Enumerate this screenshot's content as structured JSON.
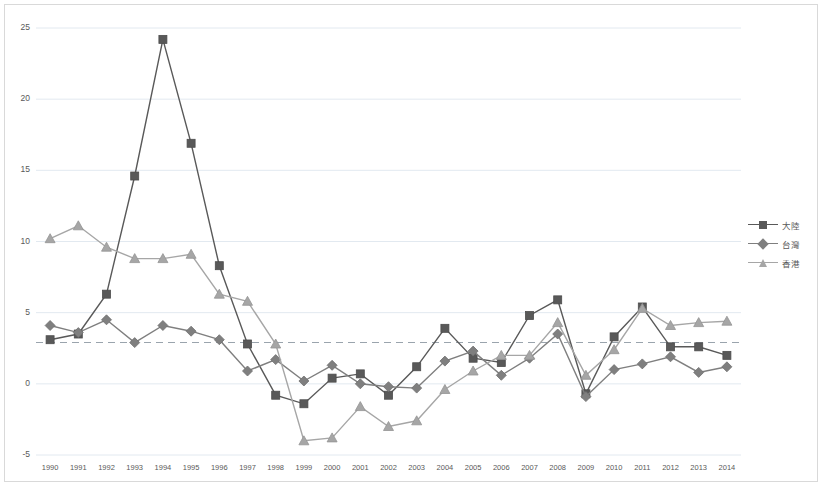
{
  "chart_data": {
    "type": "line",
    "title": "",
    "xlabel": "",
    "ylabel": "",
    "ylim": [
      -5,
      25
    ],
    "yticks": [
      -5,
      0,
      5,
      10,
      15,
      20,
      25
    ],
    "grid": true,
    "legend_position": "right",
    "reference_line": {
      "value": 2.9,
      "style": "dashed"
    },
    "categories": [
      "1990",
      "1991",
      "1992",
      "1993",
      "1994",
      "1995",
      "1996",
      "1997",
      "1998",
      "1999",
      "2000",
      "2001",
      "2002",
      "2003",
      "2004",
      "2005",
      "2006",
      "2007",
      "2008",
      "2009",
      "2010",
      "2011",
      "2012",
      "2013",
      "2014"
    ],
    "series": [
      {
        "name": "大陸",
        "marker": "square",
        "color": "#595959",
        "values": [
          3.1,
          3.5,
          6.3,
          14.6,
          24.2,
          16.9,
          8.3,
          2.8,
          -0.8,
          -1.4,
          0.4,
          0.7,
          -0.8,
          1.2,
          3.9,
          1.8,
          1.5,
          4.8,
          5.9,
          -0.7,
          3.3,
          5.4,
          2.6,
          2.6,
          2.0
        ]
      },
      {
        "name": "台灣",
        "marker": "diamond",
        "color": "#7f7f7f",
        "values": [
          4.1,
          3.6,
          4.5,
          2.9,
          4.1,
          3.7,
          3.1,
          0.9,
          1.7,
          0.2,
          1.3,
          0.0,
          -0.2,
          -0.3,
          1.6,
          2.3,
          0.6,
          1.8,
          3.5,
          -0.9,
          1.0,
          1.4,
          1.9,
          0.8,
          1.2
        ]
      },
      {
        "name": "香港",
        "marker": "triangle",
        "color": "#a6a6a6",
        "values": [
          10.2,
          11.1,
          9.6,
          8.8,
          8.8,
          9.1,
          6.3,
          5.8,
          2.8,
          -4.0,
          -3.8,
          -1.6,
          -3.0,
          -2.6,
          -0.4,
          0.9,
          2.0,
          2.0,
          4.3,
          0.6,
          2.4,
          5.3,
          4.1,
          4.3,
          4.4
        ]
      }
    ]
  },
  "legend": {
    "items": [
      {
        "label": "大陸",
        "marker": "square"
      },
      {
        "label": "台灣",
        "marker": "diamond"
      },
      {
        "label": "香港",
        "marker": "triangle"
      }
    ]
  }
}
